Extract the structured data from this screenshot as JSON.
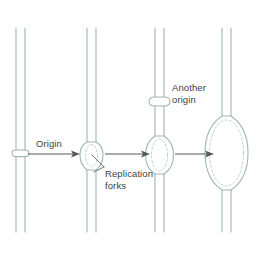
{
  "figure": {
    "background_color": "#ffffff",
    "strand_color": "#9fb6b4",
    "arrow_color": "#55595b",
    "label_color": "#3b3f41",
    "width": 259,
    "height": 254
  },
  "labels": {
    "origin": "Origin",
    "another_origin": "Another\norigin",
    "replication_forks": "Replication\nforks"
  },
  "stages": [
    {
      "name": "stage-1-origin",
      "order": 1,
      "strand_x": [
        16,
        25
      ],
      "feature": "origin-mark",
      "feature_y": 153,
      "feature_width": 9,
      "feature_height": 4,
      "label": "Origin"
    },
    {
      "name": "stage-2-small-bubble",
      "order": 2,
      "strand_x": [
        87,
        96
      ],
      "feature": "replication-bubble",
      "feature_y": 155,
      "feature_width": 13,
      "feature_height": 24,
      "label": "Replication forks"
    },
    {
      "name": "stage-3-medium-bubble",
      "order": 3,
      "strand_x": [
        155,
        164
      ],
      "feature": "replication-bubble",
      "feature_y": 155,
      "feature_width": 19,
      "feature_height": 36,
      "second_origin_y": 101,
      "label": "Another origin"
    },
    {
      "name": "stage-4-large-bubble",
      "order": 4,
      "strand_x": [
        222,
        231
      ],
      "feature": "replication-bubble",
      "feature_y": 150,
      "feature_width": 38,
      "feature_height": 74,
      "label": ""
    }
  ],
  "arrows": [
    {
      "name": "arrow-1-to-2",
      "x1": 28,
      "x2": 80,
      "y": 154
    },
    {
      "name": "arrow-2-to-3",
      "x1": 104,
      "x2": 150,
      "y": 154
    },
    {
      "name": "arrow-3-to-4",
      "x1": 172,
      "x2": 214,
      "y": 154
    }
  ],
  "leaders": [
    {
      "name": "leader-fork-upper",
      "x1": 103,
      "y1": 167,
      "x2": 93,
      "y2": 158
    },
    {
      "name": "leader-fork-lower",
      "x1": 103,
      "y1": 167,
      "x2": 95,
      "y2": 173
    }
  ]
}
